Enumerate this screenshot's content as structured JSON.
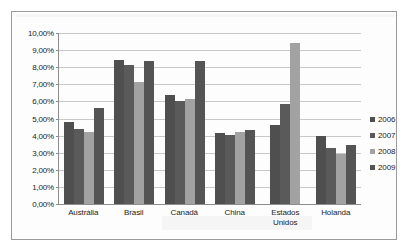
{
  "chart_data": {
    "type": "bar",
    "title": "",
    "xlabel": "",
    "ylabel": "",
    "categories": [
      "Austrália",
      "Brasil",
      "Canadá",
      "China",
      "Estados Unidos",
      "Holanda"
    ],
    "series": [
      {
        "name": "2006",
        "color": "#4f4f4f",
        "values": [
          4.8,
          8.4,
          6.35,
          4.15,
          4.65,
          3.95
        ]
      },
      {
        "name": "2007",
        "color": "#5a5a5a",
        "values": [
          4.4,
          8.15,
          6.05,
          4.05,
          5.85,
          3.3
        ]
      },
      {
        "name": "2008",
        "color": "#a2a2a2",
        "values": [
          4.2,
          7.15,
          6.15,
          4.2,
          9.4,
          2.9
        ]
      },
      {
        "name": "2009",
        "color": "#545454",
        "values": [
          5.6,
          8.35,
          8.35,
          4.35,
          null,
          3.45
        ]
      }
    ],
    "ylim": [
      0,
      10
    ],
    "ytick_values": [
      0,
      1,
      2,
      3,
      4,
      5,
      6,
      7,
      8,
      9,
      10
    ],
    "ytick_labels": [
      "0,00%",
      "1,00%",
      "2,00%",
      "3,00%",
      "4,00%",
      "5,00%",
      "6,00%",
      "7,00%",
      "8,00%",
      "9,00%",
      "10,00%"
    ],
    "grid": true,
    "legend_position": "right",
    "value_suffix": "%",
    "decimal_separator": ","
  }
}
